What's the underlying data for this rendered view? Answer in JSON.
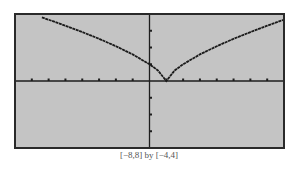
{
  "caption": "[−8,8] by [−4,4]",
  "colors": {
    "screen_bg": "#c4c4c4",
    "frame": "#2a2a2a",
    "axis": "#1e1e1e",
    "curve": "#1a1a1a"
  },
  "chart_data": {
    "type": "line",
    "title": "",
    "xlabel": "",
    "ylabel": "",
    "xlim": [
      -8,
      8
    ],
    "ylim": [
      -4,
      4
    ],
    "grid": false,
    "legend": null,
    "x_ticks": [
      -7,
      -6,
      -5,
      -4,
      -3,
      -2,
      -1,
      1,
      2,
      3,
      4,
      5,
      6,
      7
    ],
    "y_ticks": [
      -3,
      -2,
      -1,
      1,
      2,
      3
    ],
    "annotations": [
      "[−8,8] by [−4,4]"
    ],
    "series": [
      {
        "name": "y = |x − 1|^(2/3)",
        "x": [
          -6.4,
          -6,
          -5,
          -4,
          -3,
          -2,
          -1,
          0,
          0.5,
          1,
          1.5,
          2,
          3,
          4,
          5,
          6,
          7,
          8
        ],
        "values": [
          3.8,
          3.66,
          3.3,
          2.92,
          2.52,
          2.08,
          1.59,
          1.0,
          0.63,
          0.0,
          0.63,
          1.0,
          1.59,
          2.08,
          2.52,
          2.92,
          3.3,
          3.66
        ]
      }
    ]
  }
}
